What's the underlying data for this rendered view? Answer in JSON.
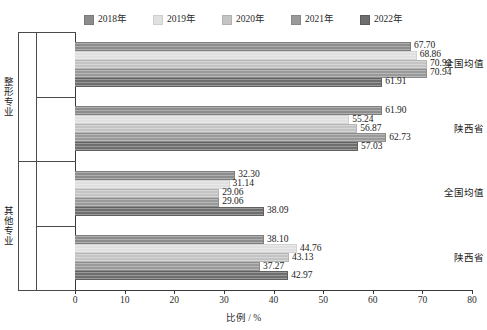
{
  "chart_data": {
    "type": "bar",
    "orientation": "horizontal",
    "title": "",
    "xlabel": "比例 / %",
    "ylabel": "",
    "xlim": [
      0,
      80
    ],
    "xticks": [
      0,
      10,
      20,
      30,
      40,
      50,
      60,
      70,
      80
    ],
    "grid": false,
    "legend_position": "top",
    "series": [
      {
        "name": "2018年",
        "color": "#8c8c8c",
        "values": [
          67.7,
          61.9,
          32.3,
          38.1
        ]
      },
      {
        "name": "2019年",
        "color": "#e0e0e0",
        "values": [
          68.86,
          55.24,
          31.14,
          44.76
        ]
      },
      {
        "name": "2020年",
        "color": "#c4c4c4",
        "values": [
          70.94,
          56.87,
          29.06,
          43.13
        ]
      },
      {
        "name": "2021年",
        "color": "#9a9a9a",
        "values": [
          70.94,
          62.73,
          29.06,
          37.27
        ]
      },
      {
        "name": "2022年",
        "color": "#6e6e6e",
        "values": [
          61.91,
          57.03,
          38.09,
          42.97
        ]
      }
    ],
    "categories": [
      {
        "outer": "整形专业",
        "inner": "全国均值"
      },
      {
        "outer": "整形专业",
        "inner": "陕西省"
      },
      {
        "outer": "其他专业",
        "inner": "全国均值"
      },
      {
        "outer": "其他专业",
        "inner": "陕西省"
      }
    ],
    "outer_groups": [
      "整形专业",
      "其他专业"
    ],
    "inner_groups": [
      "全国均值",
      "陕西省"
    ],
    "value_labels": [
      [
        "67.70",
        "68.86",
        "70.94",
        "70.94",
        "61.91"
      ],
      [
        "61.90",
        "55.24",
        "56.87",
        "62.73",
        "57.03"
      ],
      [
        "32.30",
        "31.14",
        "29.06",
        "29.06",
        "38.09"
      ],
      [
        "38.10",
        "44.76",
        "43.13",
        "37.27",
        "42.97"
      ]
    ]
  },
  "legend": {
    "items": [
      {
        "label": "2018年",
        "color": "#8c8c8c"
      },
      {
        "label": "2019年",
        "color": "#e0e0e0"
      },
      {
        "label": "2020年",
        "color": "#c4c4c4"
      },
      {
        "label": "2021年",
        "color": "#9a9a9a"
      },
      {
        "label": "2022年",
        "color": "#6e6e6e"
      }
    ]
  },
  "axis": {
    "x_title": "比例 / %",
    "x_tick_labels": [
      "0",
      "10",
      "20",
      "30",
      "40",
      "50",
      "60",
      "70",
      "80"
    ]
  }
}
